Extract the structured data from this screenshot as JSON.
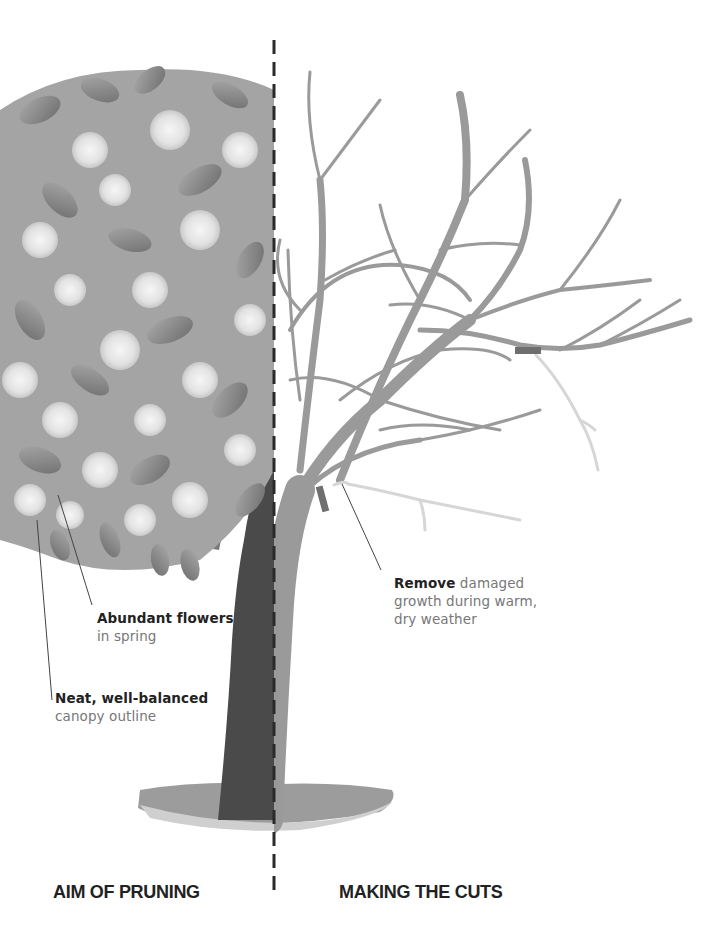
{
  "illustration": {
    "subject": "Pruning a flowering tree",
    "left_half": "tree in full bloom with leaves and flower clusters",
    "right_half": "bare branch structure with cut markers",
    "divider": "vertical dashed line"
  },
  "annotations": {
    "flowers": {
      "bold": "Abundant flowers",
      "rest": "in spring"
    },
    "canopy": {
      "bold": "Neat, well-balanced",
      "rest": "canopy outline"
    },
    "remove": {
      "bold": "Remove",
      "rest_line1": " damaged",
      "rest_line2": "growth during warm,",
      "rest_line3": "dry weather"
    }
  },
  "headings": {
    "left": "AIM OF PRUNING",
    "right": "MAKING THE CUTS"
  },
  "colors": {
    "branch": "#9a9a9a",
    "trunk_dark": "#4a4a4a",
    "damaged_growth": "#d6d6d6",
    "cut_marker": "#6f6f6f",
    "divider": "#2a2a2a",
    "leaf": "#8c8c8c",
    "flower": "#ececec"
  }
}
